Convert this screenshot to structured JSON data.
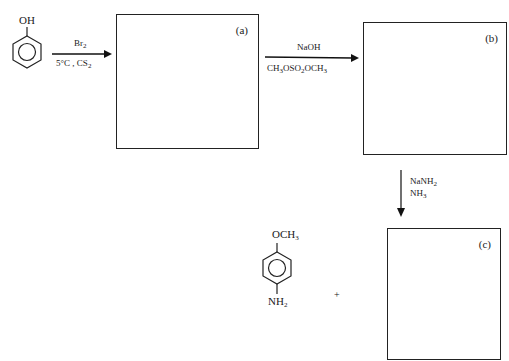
{
  "header": {
    "question_number_partial": "..."
  },
  "reactant": {
    "name": "phenol",
    "substituent": "OH"
  },
  "steps": [
    {
      "id": "step1",
      "reagent_top": "Br",
      "reagent_top_sub": "2",
      "reagent_bottom": "5°C , CS",
      "reagent_bottom_sub": "2",
      "direction": "right"
    },
    {
      "id": "step2",
      "reagent_top": "NaOH",
      "reagent_bottom_parts": [
        "CH",
        "3",
        "OSO",
        "2",
        "OCH",
        "3"
      ],
      "direction": "right"
    },
    {
      "id": "step3",
      "reagent_lines": [
        {
          "text": "NaNH",
          "sub": "2"
        },
        {
          "text": "NH",
          "sub": "3"
        }
      ],
      "direction": "down"
    }
  ],
  "boxes": [
    {
      "id": "a",
      "label": "(a)"
    },
    {
      "id": "b",
      "label": "(b)"
    },
    {
      "id": "c",
      "label": "(c)"
    }
  ],
  "byproduct": {
    "name": "p-anisidine",
    "top_group": "OCH",
    "top_sub": "3",
    "bottom_group": "NH",
    "bottom_sub": "2"
  },
  "plus_sign": "+"
}
